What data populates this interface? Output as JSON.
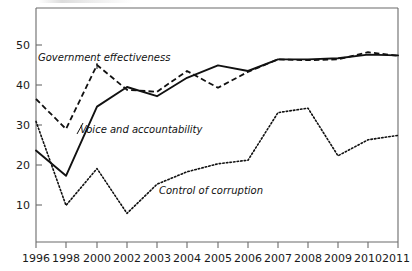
{
  "chart_data": {
    "type": "line",
    "title": "",
    "subtitle": "",
    "xlabel": "",
    "ylabel": "",
    "x": [
      "1996",
      "1998",
      "2000",
      "2002",
      "2003",
      "2004",
      "2005",
      "2006",
      "2007",
      "2008",
      "2009",
      "2010",
      "2011"
    ],
    "categories": [
      "1996",
      "1998",
      "2000",
      "2002",
      "2003",
      "2004",
      "2005",
      "2006",
      "2007",
      "2008",
      "2009",
      "2010",
      "2011"
    ],
    "xtick_labels": [
      "1996",
      "1998",
      "2000",
      "2002",
      "2003",
      "2004",
      "2005",
      "2006",
      "2007",
      "2008",
      "2009",
      "2010",
      "2011"
    ],
    "ytick_labels": [
      "10",
      "20",
      "30",
      "40",
      "50"
    ],
    "yticks": [
      10,
      20,
      30,
      40,
      50
    ],
    "ylim": [
      0,
      58
    ],
    "xlim_index": [
      0,
      12
    ],
    "grid": false,
    "legend": "inline-annotations",
    "legend_position": "inline",
    "series": [
      {
        "name": "Government effectiveness",
        "style": "dashed",
        "color": "#111111",
        "values": [
          36.5,
          29.0,
          45.0,
          38.8,
          38.3,
          43.5,
          39.3,
          43.3,
          46.4,
          46.2,
          46.4,
          48.2,
          47.3
        ]
      },
      {
        "name": "Voice and accountability",
        "style": "solid",
        "color": "#111111",
        "values": [
          23.6,
          17.3,
          34.6,
          39.5,
          37.2,
          41.8,
          44.9,
          43.5,
          46.4,
          46.4,
          46.7,
          47.6,
          47.4
        ]
      },
      {
        "name": "Control of corruption",
        "style": "dotted",
        "color": "#111111",
        "values": [
          30.9,
          9.9,
          19.1,
          7.9,
          15.2,
          18.3,
          20.3,
          21.2,
          33.1,
          34.2,
          22.3,
          26.3,
          27.4
        ]
      }
    ],
    "annotations": [
      {
        "text": "Government effectiveness",
        "series": "Government effectiveness"
      },
      {
        "text": "Voice and accountability",
        "series": "Voice and accountability"
      },
      {
        "text": "Control of corruption",
        "series": "Control of corruption"
      }
    ]
  },
  "axis": {
    "y_tick_10": "10",
    "y_tick_20": "20",
    "y_tick_30": "30",
    "y_tick_40": "40",
    "y_tick_50": "50"
  },
  "labels": {
    "government_effectiveness": "Government effectiveness",
    "voice_and_accountability": "Voice and accountability",
    "control_of_corruption": "Control of corruption"
  },
  "xaxis": {
    "t0": "1996",
    "t1": "1998",
    "t2": "2000",
    "t3": "2002",
    "t4": "2003",
    "t5": "2004",
    "t6": "2005",
    "t7": "2006",
    "t8": "2007",
    "t9": "2008",
    "t10": "2009",
    "t11": "2010",
    "t12": "2011"
  },
  "colors": {
    "ink": "#111111",
    "axis": "#6b6b6b",
    "background": "#ffffff"
  }
}
